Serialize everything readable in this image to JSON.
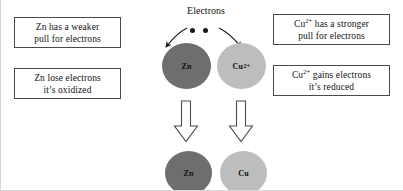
{
  "diagram": {
    "title_label": "Electrons",
    "boxes": [
      {
        "name": "zn-weaker-pull",
        "line1": "Zn has a weaker",
        "line2": "pull for electrons"
      },
      {
        "name": "zn-lose",
        "line1": "Zn lose electrons",
        "line2": "it’s oxidized"
      },
      {
        "name": "cu-stronger-pull",
        "line1_prefix": "Cu",
        "line1_sup": "2+",
        "line1_suffix": " has a stronger",
        "line2": "pull for electrons"
      },
      {
        "name": "cu-gains",
        "line1_prefix": "Cu",
        "line1_sup": "2+",
        "line1_suffix": " gains electrons",
        "line2": "it’s reduced"
      }
    ],
    "atoms": [
      {
        "name": "zn-ion-top",
        "label": "Zn",
        "sup": "",
        "fill": "#6e6e6e"
      },
      {
        "name": "cu-ion-top",
        "label": "Cu",
        "sup": "2+",
        "fill": "#bdbdbd"
      },
      {
        "name": "zn-metal",
        "label": "Zn",
        "sup": "",
        "fill": "#6e6e6e"
      },
      {
        "name": "cu-metal",
        "label": "Cu",
        "sup": "",
        "fill": "#bdbdbd"
      }
    ],
    "electron_dots": 2,
    "colors": {
      "zinc_fill": "#6e6e6e",
      "copper_fill": "#bdbdbd",
      "box_border": "#4a4a4a",
      "text": "#141414",
      "arrow_outline": "#3a3a3a",
      "background": "#ffffff"
    }
  }
}
